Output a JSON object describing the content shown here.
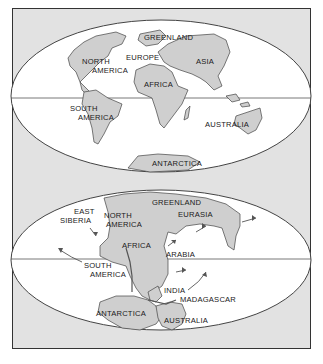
{
  "caption_fragment": "",
  "colors": {
    "frame_bg": "#e2e2e2",
    "ocean": "#ffffff",
    "land": "#cfcfcf",
    "outline": "#444444",
    "text": "#1a1a1a"
  },
  "present_map": {
    "labels": {
      "greenland": "GREENLAND",
      "north_america_1": "NORTH",
      "north_america_2": "AMERICA",
      "europe": "EUROPE",
      "asia": "ASIA",
      "africa": "AFRICA",
      "south_america_1": "SOUTH",
      "south_america_2": "AMERICA",
      "australia": "AUSTRALIA",
      "antarctica": "ANTARCTICA"
    }
  },
  "pangaea_map": {
    "labels": {
      "east_siberia_1": "EAST",
      "east_siberia_2": "SIBERIA",
      "north_america_1": "NORTH",
      "north_america_2": "AMERICA",
      "greenland": "GREENLAND",
      "eurasia": "EURASIA",
      "africa": "AFRICA",
      "arabia": "ARABIA",
      "south_america_1": "SOUTH",
      "south_america_2": "AMERICA",
      "india": "INDIA",
      "madagascar": "MADAGASCAR",
      "antarctica": "ANTARCTICA",
      "australia": "AUSTRALIA"
    },
    "arrows": 7
  }
}
